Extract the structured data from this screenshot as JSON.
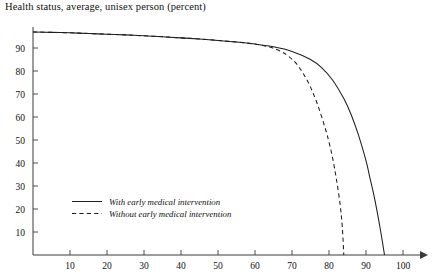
{
  "chart_data": {
    "type": "line",
    "title": "Health status, average, unisex person (percent)",
    "xlabel": "",
    "ylabel": "",
    "xlim": [
      0,
      105
    ],
    "ylim": [
      0,
      100
    ],
    "grid": false,
    "legend_position": "inside-lower-left",
    "x_ticks": [
      10,
      20,
      30,
      40,
      50,
      60,
      70,
      80,
      90,
      100
    ],
    "y_ticks": [
      10,
      20,
      30,
      40,
      50,
      60,
      70,
      80,
      90
    ],
    "x_axis_arrow": true,
    "series": [
      {
        "name": "With early medical intervention",
        "style": "solid",
        "color": "#1d1d1d",
        "x": [
          0,
          5,
          10,
          15,
          20,
          25,
          30,
          35,
          40,
          45,
          50,
          55,
          60,
          65,
          70,
          75,
          78,
          81,
          84,
          86,
          88,
          90,
          91,
          92,
          93,
          94,
          95
        ],
        "y": [
          97,
          96.8,
          96.6,
          96.3,
          96,
          95.7,
          95.3,
          94.9,
          94.4,
          93.9,
          93.3,
          92.6,
          91.7,
          90.5,
          88.5,
          85,
          81.5,
          76,
          68,
          61,
          52,
          41,
          34,
          27,
          19,
          10,
          0
        ]
      },
      {
        "name": "Without early medical intervention",
        "style": "dashed",
        "color": "#1d1d1d",
        "x": [
          0,
          5,
          10,
          15,
          20,
          25,
          30,
          35,
          40,
          45,
          50,
          55,
          60,
          64,
          67,
          69,
          71,
          73,
          75,
          77,
          79,
          80,
          81,
          82,
          83,
          83.6,
          84
        ],
        "y": [
          97,
          96.8,
          96.6,
          96.3,
          96,
          95.7,
          95.3,
          94.9,
          94.4,
          93.9,
          93.3,
          92.6,
          91.7,
          90.4,
          88.5,
          86.5,
          83.5,
          79,
          73,
          65,
          55,
          49,
          42,
          33,
          22,
          12,
          0
        ]
      }
    ],
    "legend": [
      {
        "label": "With early medical intervention",
        "style": "solid"
      },
      {
        "label": "Without early medical intervention",
        "style": "dashed"
      }
    ]
  }
}
